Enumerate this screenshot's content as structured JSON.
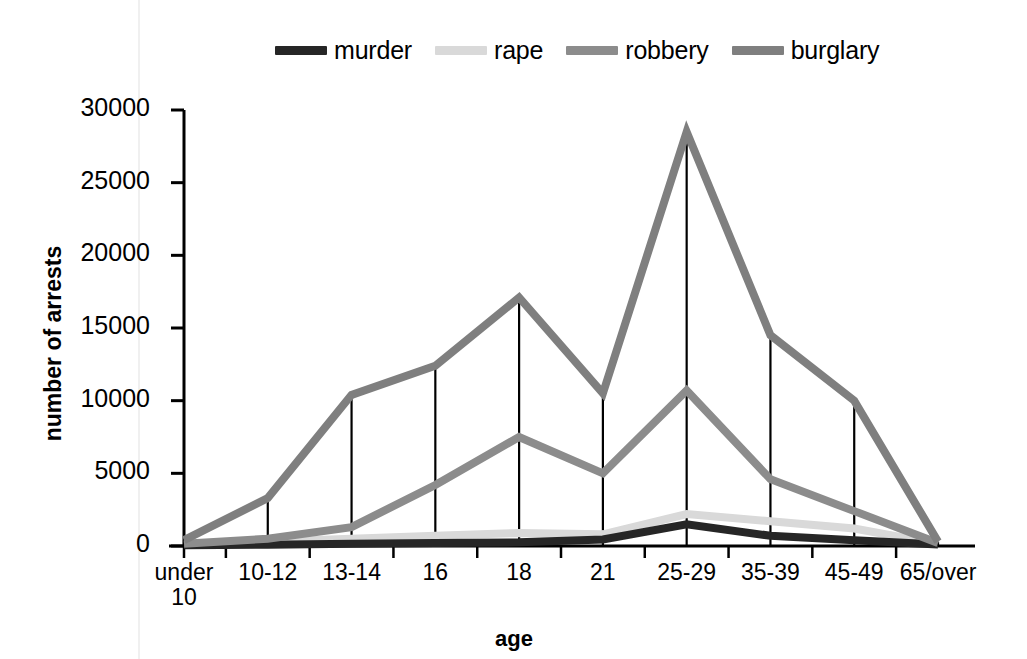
{
  "chart_data": {
    "type": "line",
    "title": "",
    "xlabel": "age",
    "ylabel": "number of arrests",
    "categories": [
      "under 10",
      "10-12",
      "13-14",
      "16",
      "18",
      "21",
      "25-29",
      "35-39",
      "45-49",
      "65/over"
    ],
    "ylim": [
      0,
      30000
    ],
    "ytick_labels": [
      "0",
      "5000",
      "10000",
      "15000",
      "20000",
      "25000",
      "30000"
    ],
    "ytick_values": [
      0,
      5000,
      10000,
      15000,
      20000,
      25000,
      30000
    ],
    "grid": false,
    "legend_position": "top",
    "series": [
      {
        "name": "murder",
        "color": "#262626",
        "values": [
          60,
          90,
          150,
          200,
          250,
          450,
          1500,
          700,
          400,
          100
        ]
      },
      {
        "name": "rape",
        "color": "#d9d9d9",
        "values": [
          80,
          300,
          500,
          700,
          900,
          800,
          2200,
          1700,
          1200,
          150
        ]
      },
      {
        "name": "robbery",
        "color": "#8c8c8c",
        "values": [
          150,
          500,
          1300,
          4200,
          7500,
          5000,
          10700,
          4600,
          2400,
          200
        ]
      },
      {
        "name": "burglary",
        "color": "#7f7f7f",
        "values": [
          400,
          3300,
          10400,
          12400,
          17100,
          10500,
          28500,
          14500,
          10000,
          300
        ]
      }
    ]
  },
  "legend": {
    "items": [
      {
        "label": "murder",
        "color": "#262626"
      },
      {
        "label": "rape",
        "color": "#d9d9d9"
      },
      {
        "label": "robbery",
        "color": "#8c8c8c"
      },
      {
        "label": "burglary",
        "color": "#7f7f7f"
      }
    ]
  },
  "axes": {
    "x_title": "age",
    "y_title": "number of arrests"
  }
}
